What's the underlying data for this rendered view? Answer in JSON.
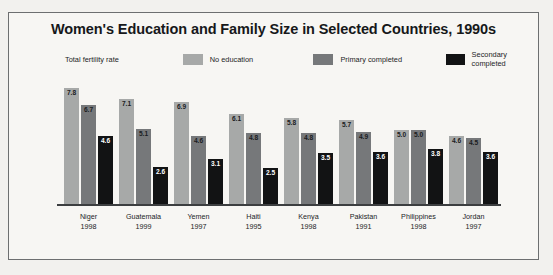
{
  "chart_data": {
    "type": "bar",
    "title": "Women's Education and Family Size in Selected Countries, 1990s",
    "xlabel": "",
    "ylabel": "Total fertility rate",
    "ylim": [
      0,
      8.2
    ],
    "grid": false,
    "legend_position": "top",
    "categories": [
      "Niger",
      "Guatemala",
      "Yemen",
      "Haiti",
      "Kenya",
      "Pakistan",
      "Philippines",
      "Jordan"
    ],
    "category_years": [
      "1998",
      "1999",
      "1997",
      "1995",
      "1998",
      "1991",
      "1998",
      "1997"
    ],
    "series": [
      {
        "name": "No education",
        "color": "#a7a9a8",
        "values": [
          7.8,
          7.1,
          6.9,
          6.1,
          5.8,
          5.7,
          5.0,
          4.6
        ],
        "labels": [
          "7.8",
          "7.1",
          "6.9",
          "6.1",
          "5.8",
          "5.7",
          "5.0",
          "4.6"
        ]
      },
      {
        "name": "Primary completed",
        "color": "#76787a",
        "values": [
          6.7,
          5.1,
          4.6,
          4.8,
          4.8,
          4.9,
          5.0,
          4.5
        ],
        "labels": [
          "6.7",
          "5.1",
          "4.6",
          "4.8",
          "4.8",
          "4.9",
          "5.0",
          "4.5"
        ]
      },
      {
        "name": "Secondary completed",
        "color": "#121314",
        "values": [
          4.6,
          2.6,
          3.1,
          2.5,
          3.5,
          3.6,
          3.8,
          3.6
        ],
        "labels": [
          "4.6",
          "2.6",
          "3.1",
          "2.5",
          "3.5",
          "3.6",
          "3.8",
          "3.6"
        ]
      }
    ]
  }
}
